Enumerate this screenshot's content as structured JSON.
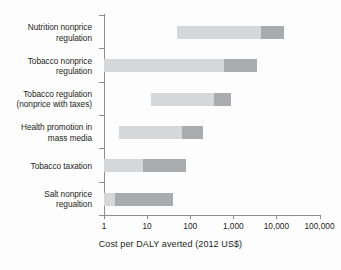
{
  "chart_data": {
    "type": "bar",
    "orientation": "horizontal",
    "subtype": "range-bar-log",
    "title": "",
    "xlabel": "Cost per DALY averted (2012 US$)",
    "ylabel": "",
    "xscale": "log",
    "xlim": [
      1,
      100000
    ],
    "grid": false,
    "legend": null,
    "xticks": [
      1,
      10,
      100,
      1000,
      10000,
      100000
    ],
    "xtick_labels": [
      "1",
      "10",
      "100",
      "1,000",
      "10,000",
      "100,000"
    ],
    "categories": [
      "Nutrition nonprice regulation",
      "Tobacco nonprice regulation",
      "Tobacco regulation (nonprice with taxes)",
      "Health promotion in mass media",
      "Tobacco taxation",
      "Salt nonprice regualtion"
    ],
    "category_labels": [
      [
        "Nutrition nonprice",
        "regulation"
      ],
      [
        "Tobacco nonprice",
        "regulation"
      ],
      [
        "Tobacco regulation",
        "(nonprice with taxes)"
      ],
      [
        "Health promotion in",
        "mass media"
      ],
      [
        "Tobacco taxation"
      ],
      [
        "Salt nonprice",
        "regualtion"
      ]
    ],
    "series": [
      {
        "name": "lower range",
        "color": "#d6d7d9",
        "values": [
          {
            "start": 50,
            "end": 4500
          },
          {
            "start": 1,
            "end": 600
          },
          {
            "start": 12,
            "end": 350
          },
          {
            "start": 2.2,
            "end": 65
          },
          {
            "start": 1,
            "end": 8
          },
          {
            "start": 1,
            "end": 1.8
          }
        ]
      },
      {
        "name": "upper range",
        "color": "#a9abac",
        "values": [
          {
            "start": 4500,
            "end": 15000
          },
          {
            "start": 600,
            "end": 3500
          },
          {
            "start": 350,
            "end": 900
          },
          {
            "start": 65,
            "end": 200
          },
          {
            "start": 8,
            "end": 80
          },
          {
            "start": 1.8,
            "end": 40
          }
        ]
      }
    ],
    "colors": {
      "light_segment": "#d6d7d9",
      "dark_segment": "#a9abac",
      "axis": "#8a8c8f",
      "text": "#231f20",
      "background": "#fdfdfd"
    }
  }
}
